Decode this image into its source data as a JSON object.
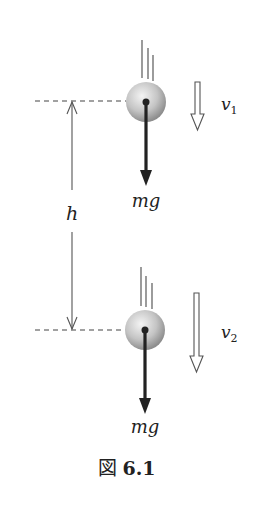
{
  "figure": {
    "caption_prefix": "図",
    "caption_number": "6.1"
  },
  "labels": {
    "height": "h",
    "force_top": "mg",
    "force_bottom": "mg",
    "velocity_top_base": "v",
    "velocity_top_sub": "1",
    "velocity_bottom_base": "v",
    "velocity_bottom_sub": "2"
  },
  "colors": {
    "ink": "#222222",
    "thin_line": "#555555",
    "ball_light": "#f2f2f2",
    "ball_dark": "#8a8a8a"
  }
}
